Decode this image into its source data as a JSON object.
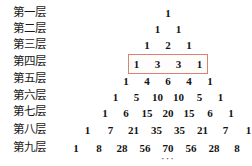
{
  "figure": {
    "background_color": "#ffffff",
    "text_color": "#121212",
    "highlight_color": "#d98472",
    "highlight_fill": "#fffdfc",
    "ellipsis": "···"
  },
  "rows": [
    {
      "label": "第一层",
      "label_top": 6,
      "row_top": 7,
      "width_class": "w-narrow",
      "values": [
        "1"
      ]
    },
    {
      "label": "第二层",
      "label_top": 22,
      "row_top": 23,
      "width_class": "w-narrow",
      "values": [
        "1",
        "1"
      ]
    },
    {
      "label": "第三层",
      "label_top": 38,
      "row_top": 39,
      "width_class": "w-narrow",
      "values": [
        "1",
        "2",
        "1"
      ]
    },
    {
      "label": "第四层",
      "label_top": 55,
      "row_top": 58,
      "width_class": "w-narrow",
      "values": [
        "1",
        "3",
        "3",
        "1"
      ],
      "highlighted": true
    },
    {
      "label": "第五层",
      "label_top": 72,
      "row_top": 75,
      "width_class": "w-narrow",
      "values": [
        "1",
        "4",
        "6",
        "4",
        "1"
      ]
    },
    {
      "label": "第六层",
      "label_top": 89,
      "row_top": 91,
      "width_class": "w-narrow",
      "values": [
        "1",
        "5",
        "10",
        "10",
        "5",
        "1"
      ]
    },
    {
      "label": "第七层",
      "label_top": 105,
      "row_top": 107,
      "width_class": "w-narrow",
      "values": [
        "1",
        "6",
        "15",
        "20",
        "15",
        "6",
        "1"
      ]
    },
    {
      "label": "第八层",
      "label_top": 123,
      "row_top": 124,
      "width_class": "w-mid",
      "values": [
        "1",
        "7",
        "21",
        "35",
        "35",
        "21",
        "7",
        "1"
      ]
    },
    {
      "label": "第九层",
      "label_top": 141,
      "row_top": 142,
      "width_class": "w-mid",
      "values": [
        "1",
        "8",
        "28",
        "56",
        "70",
        "56",
        "28",
        "8",
        "1"
      ]
    }
  ],
  "highlight_box": {
    "left": 128,
    "top": 54,
    "width": 80,
    "height": 20
  },
  "ellipsis_row": {
    "text": "···",
    "top": 152
  }
}
